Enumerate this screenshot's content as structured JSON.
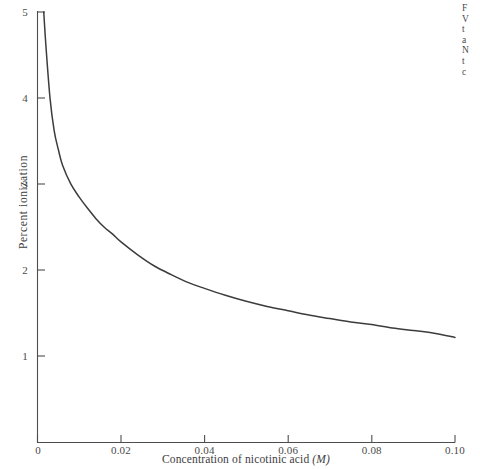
{
  "figure": {
    "axis_color": "#4d4d4d",
    "curve_color": "#3c3c3c",
    "background": "#ffffff",
    "caption_lines": [
      "F",
      "V",
      "t",
      "a",
      "N",
      "t",
      "c"
    ]
  },
  "chart_data": {
    "type": "line",
    "title": "",
    "xlabel": "Concentration of nicotinic acid",
    "xlabel_unit": "(M)",
    "ylabel": "Percent ionization",
    "xlim": [
      0,
      0.1
    ],
    "ylim": [
      0,
      5
    ],
    "grid": false,
    "legend": "none",
    "xticks": [
      0,
      0.02,
      0.04,
      0.06,
      0.08,
      0.1
    ],
    "xtick_labels": [
      "0",
      "0.02",
      "0.04",
      "0.06",
      "0.08",
      "0.10"
    ],
    "yticks": [
      1,
      2,
      3,
      4,
      5
    ],
    "ytick_labels": [
      "1",
      "2",
      "3",
      "4",
      "5"
    ],
    "series": [
      {
        "name": "Percent ionization of nicotinic acid",
        "x": [
          0.0015,
          0.002,
          0.003,
          0.004,
          0.005,
          0.006,
          0.008,
          0.01,
          0.012,
          0.014,
          0.016,
          0.018,
          0.02,
          0.024,
          0.028,
          0.032,
          0.036,
          0.04,
          0.045,
          0.05,
          0.055,
          0.06,
          0.065,
          0.07,
          0.075,
          0.08,
          0.085,
          0.09,
          0.095,
          0.1
        ],
        "y": [
          5.0,
          4.62,
          4.0,
          3.62,
          3.4,
          3.22,
          3.0,
          2.85,
          2.72,
          2.6,
          2.5,
          2.42,
          2.33,
          2.18,
          2.05,
          1.95,
          1.86,
          1.79,
          1.71,
          1.64,
          1.58,
          1.53,
          1.48,
          1.44,
          1.4,
          1.37,
          1.33,
          1.3,
          1.27,
          1.22
        ]
      }
    ]
  }
}
